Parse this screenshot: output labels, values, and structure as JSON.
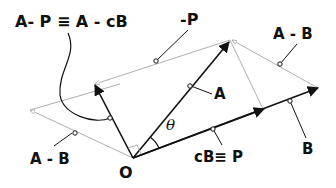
{
  "labels": {
    "a_minus_p": "A- P ≡ A - cB",
    "neg_p": "-P",
    "a_minus_b_top": "A - B",
    "a": "A",
    "a_minus_b_left": "A - B",
    "origin": "O",
    "cb_p": "cB≡ P",
    "b": "B",
    "theta": "θ"
  },
  "colors": {
    "vector": "#111111",
    "guide": "#999999"
  }
}
